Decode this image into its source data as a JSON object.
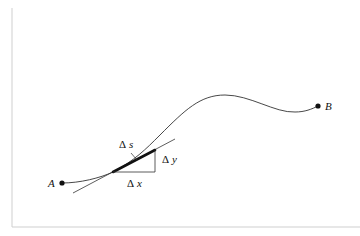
{
  "diagram": {
    "points": {
      "A": {
        "label": "A"
      },
      "B": {
        "label": "B"
      }
    },
    "labels": {
      "delta_s": {
        "delta": "Δ",
        "var": "s"
      },
      "delta_x": {
        "delta": "Δ",
        "var": "x"
      },
      "delta_y": {
        "delta": "Δ",
        "var": "y"
      }
    },
    "colors": {
      "stroke": "#222222",
      "frame": "#cccccc",
      "background": "#ffffff"
    }
  }
}
